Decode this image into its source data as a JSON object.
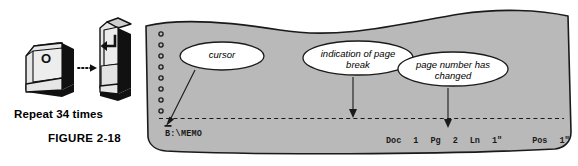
{
  "figure": {
    "caption_repeat": "Repeat 34 times",
    "caption_figure": "FIGURE 2-18"
  },
  "keyboard": {
    "left_key": {
      "icon": "letter-o-keycap",
      "label": "O"
    },
    "arrow": {
      "icon": "dotted-right-arrow-icon"
    },
    "right_key": {
      "icon": "enter-keycap",
      "label": "↵"
    }
  },
  "callouts": [
    {
      "id": "cursor",
      "text": "cursor"
    },
    {
      "id": "page-break",
      "text": "indication of page\nbreak"
    },
    {
      "id": "page-number",
      "text": "page number has\nchanged"
    }
  ],
  "screen": {
    "punch_holes_count": 9,
    "cursor_glyph": "_",
    "filename": "B:\\MEMO",
    "page_break_line": "dashed",
    "status": {
      "doc_label": "Doc",
      "doc_value": "1",
      "pg_label": "Pg",
      "pg_value": "2",
      "ln_label": "Ln",
      "ln_value": "1\"",
      "pos_label": "Pos",
      "pos_value": "1\""
    }
  },
  "colors": {
    "paper_fill": "#b9b9b9",
    "paper_stroke": "#1a1a1a",
    "key_face": "#e2e2e2",
    "key_side": "#1a1a1a",
    "bubble_fill": "#ffffff",
    "text": "#000000",
    "background": "#ffffff"
  }
}
